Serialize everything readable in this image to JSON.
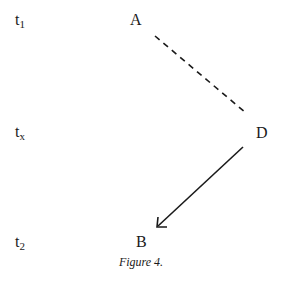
{
  "time_labels": [
    {
      "base": "t",
      "sub": "1"
    },
    {
      "base": "t",
      "sub": "x"
    },
    {
      "base": "t",
      "sub": "2"
    }
  ],
  "nodes": {
    "a": "A",
    "d": "D",
    "b": "B"
  },
  "edges": [
    {
      "from": "A",
      "to": "D",
      "style": "dashed"
    },
    {
      "from": "D",
      "to": "B",
      "style": "solid-arrow"
    }
  ],
  "caption": "Figure 4."
}
